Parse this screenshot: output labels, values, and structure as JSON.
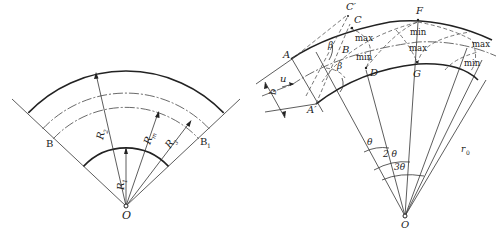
{
  "left_diagram": {
    "center_label": "O",
    "radius_labels": {
      "r1": "R",
      "r1_sub": "1",
      "r2": "R",
      "r2_sub": "2",
      "r3": "R",
      "r3_sub": "3",
      "rm": "R",
      "rm_sub": "m"
    },
    "boundary_labels": {
      "left": "B",
      "right": "B",
      "right_sub": "1"
    }
  },
  "right_diagram": {
    "center_label": "O",
    "points": {
      "A": "A",
      "A_prime": "A′",
      "B": "B",
      "C": "C",
      "C_prime": "C′",
      "D": "D",
      "F": "F",
      "G": "G"
    },
    "angles": {
      "beta_top": "β",
      "beta_bottom": "β",
      "theta1": "θ",
      "theta2": "2 θ",
      "theta3": "3θ"
    },
    "flow": {
      "velocity": "u",
      "width": "b"
    },
    "radius_label": "r",
    "radius_sub": "0",
    "extrema": [
      "max",
      "min",
      "min",
      "max",
      "max",
      "min"
    ]
  }
}
